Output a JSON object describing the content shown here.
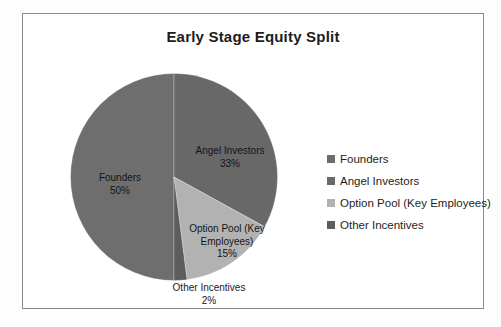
{
  "figure": {
    "background": "#fdfdfd",
    "frame_border_color": "#8a8a8a"
  },
  "chart_data": {
    "type": "pie",
    "title": "Early Stage Equity Split",
    "categories": [
      "Founders",
      "Angel Investors",
      "Option Pool (Key Employees)",
      "Other Incentives"
    ],
    "values": [
      50,
      33,
      15,
      2
    ],
    "unit": "percent",
    "colors": [
      "#6e6e6e",
      "#686868",
      "#b2b2b2",
      "#5d5d5d"
    ],
    "start_angle_deg": 180,
    "direction": "clockwise",
    "legend_position": "right",
    "grid": false,
    "labels": [
      {
        "name": "Founders",
        "value": "50%"
      },
      {
        "name": "Angel Investors",
        "value": "33%"
      },
      {
        "name": "Option Pool (Key Employees)",
        "value": "15%"
      },
      {
        "name": "Other Incentives",
        "value": "2%"
      }
    ]
  },
  "legend": {
    "items": [
      {
        "label": "Founders",
        "color": "#6e6e6e"
      },
      {
        "label": "Angel Investors",
        "color": "#686868"
      },
      {
        "label": "Option Pool (Key Employees)",
        "color": "#b2b2b2"
      },
      {
        "label": "Other Incentives",
        "color": "#5d5d5d"
      }
    ]
  }
}
